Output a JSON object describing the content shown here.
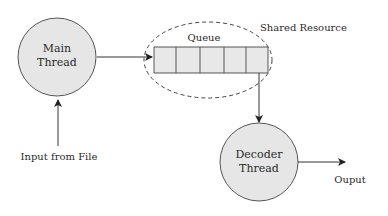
{
  "diagram": {
    "nodes": {
      "main_thread": {
        "line1": "Main",
        "line2": "Thread"
      },
      "decoder_thread": {
        "line1": "Decoder",
        "line2": "Thread"
      },
      "queue": {
        "label": "Queue",
        "cells": 5
      },
      "shared_resource": {
        "label": "Shared Resource"
      }
    },
    "labels": {
      "input": "Input from File",
      "output": "Ouput"
    },
    "edges": [
      {
        "from": "Input from File",
        "to": "Main Thread"
      },
      {
        "from": "Main Thread",
        "to": "Queue"
      },
      {
        "from": "Queue",
        "to": "Decoder Thread"
      },
      {
        "from": "Decoder Thread",
        "to": "Ouput"
      }
    ],
    "colors": {
      "node_fill": "#e6e6e6",
      "stroke": "#3a3a3a",
      "text": "#2a2a2a"
    }
  }
}
